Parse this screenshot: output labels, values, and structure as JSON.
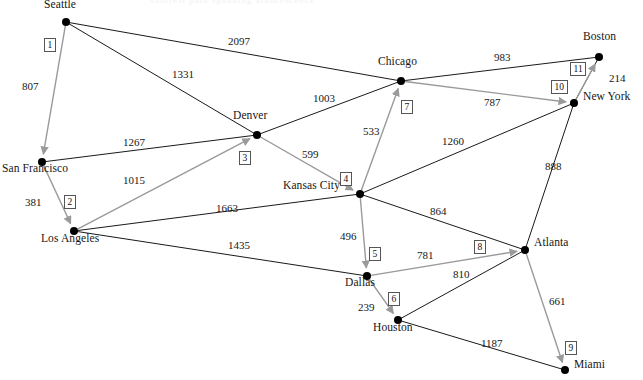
{
  "figure": {
    "title": "",
    "ghost_caption_fragment": "shortest path spanning arborescence",
    "width": 643,
    "height": 380,
    "background_color": "#ffffff",
    "tree_edge_color": "#9a9a9a",
    "graph_edge_color": "#1a1a1a",
    "node_color": "#000000"
  },
  "chart_data": {
    "type": "diagram",
    "diagram_kind": "weighted-directed-graph",
    "title": "",
    "nodes": [
      {
        "id": "seattle",
        "label": "Seattle",
        "x": 66,
        "y": 22,
        "label_dx": -22,
        "label_dy": -16
      },
      {
        "id": "san_francisco",
        "label": "San Francisco",
        "x": 42,
        "y": 162,
        "label_dx": -40,
        "label_dy": 8
      },
      {
        "id": "los_angeles",
        "label": "Los Angeles",
        "x": 74,
        "y": 231,
        "label_dx": -33,
        "label_dy": 9
      },
      {
        "id": "denver",
        "label": "Denver",
        "x": 257,
        "y": 135,
        "label_dx": -24,
        "label_dy": -18
      },
      {
        "id": "kansas_city",
        "label": "Kansas City",
        "x": 360,
        "y": 194,
        "label_dx": -77,
        "label_dy": -7
      },
      {
        "id": "chicago",
        "label": "Chicago",
        "x": 401,
        "y": 81,
        "label_dx": -23,
        "label_dy": -18
      },
      {
        "id": "boston",
        "label": "Boston",
        "x": 599,
        "y": 57,
        "label_dx": -16,
        "label_dy": -19
      },
      {
        "id": "new_york",
        "label": "New York",
        "x": 574,
        "y": 103,
        "label_dx": 9,
        "label_dy": -5
      },
      {
        "id": "atlanta",
        "label": "Atlanta",
        "x": 525,
        "y": 250,
        "label_dx": 9,
        "label_dy": -6
      },
      {
        "id": "dallas",
        "label": "Dallas",
        "x": 367,
        "y": 276,
        "label_dx": -22,
        "label_dy": 8
      },
      {
        "id": "houston",
        "label": "Houston",
        "x": 398,
        "y": 320,
        "label_dx": -25,
        "label_dy": 9
      },
      {
        "id": "miami",
        "label": "Miami",
        "x": 565,
        "y": 370,
        "label_dx": 9,
        "label_dy": -4
      }
    ],
    "edges": [
      {
        "from": "seattle",
        "to": "san_francisco",
        "weight": "807",
        "selected": true,
        "step": "1",
        "wx": 22,
        "wy": 80,
        "sx": 44,
        "sy": 38
      },
      {
        "from": "seattle",
        "to": "chicago",
        "weight": "2097",
        "selected": false,
        "step": "",
        "wx": 228,
        "wy": 35,
        "sx": 0,
        "sy": 0
      },
      {
        "from": "seattle",
        "to": "denver",
        "weight": "1331",
        "selected": false,
        "step": "",
        "wx": 172,
        "wy": 68,
        "sx": 0,
        "sy": 0
      },
      {
        "from": "san_francisco",
        "to": "los_angeles",
        "weight": "381",
        "selected": true,
        "step": "2",
        "wx": 25,
        "wy": 196,
        "sx": 64,
        "sy": 195
      },
      {
        "from": "san_francisco",
        "to": "denver",
        "weight": "1267",
        "selected": false,
        "step": "",
        "wx": 123,
        "wy": 136,
        "sx": 0,
        "sy": 0
      },
      {
        "from": "los_angeles",
        "to": "denver",
        "weight": "1015",
        "selected": true,
        "step": "3",
        "wx": 123,
        "wy": 174,
        "sx": 239,
        "sy": 151
      },
      {
        "from": "los_angeles",
        "to": "kansas_city",
        "weight": "1663",
        "selected": false,
        "step": "",
        "wx": 216,
        "wy": 202,
        "sx": 0,
        "sy": 0
      },
      {
        "from": "los_angeles",
        "to": "dallas",
        "weight": "1435",
        "selected": false,
        "step": "",
        "wx": 228,
        "wy": 239,
        "sx": 0,
        "sy": 0
      },
      {
        "from": "denver",
        "to": "kansas_city",
        "weight": "599",
        "selected": true,
        "step": "4",
        "wx": 302,
        "wy": 148,
        "sx": 340,
        "sy": 172
      },
      {
        "from": "denver",
        "to": "chicago",
        "weight": "1003",
        "selected": false,
        "step": "",
        "wx": 313,
        "wy": 92,
        "sx": 0,
        "sy": 0
      },
      {
        "from": "kansas_city",
        "to": "chicago",
        "weight": "533",
        "selected": true,
        "step": "7",
        "wx": 363,
        "wy": 125,
        "sx": 401,
        "sy": 100
      },
      {
        "from": "kansas_city",
        "to": "dallas",
        "weight": "496",
        "selected": true,
        "step": "5",
        "wx": 340,
        "wy": 230,
        "sx": 369,
        "sy": 247
      },
      {
        "from": "kansas_city",
        "to": "atlanta",
        "weight": "864",
        "selected": false,
        "step": "",
        "wx": 430,
        "wy": 205,
        "sx": 0,
        "sy": 0
      },
      {
        "from": "kansas_city",
        "to": "new_york",
        "weight": "1260",
        "selected": false,
        "step": "",
        "wx": 442,
        "wy": 135,
        "sx": 0,
        "sy": 0
      },
      {
        "from": "chicago",
        "to": "boston",
        "weight": "983",
        "selected": false,
        "step": "",
        "wx": 494,
        "wy": 51,
        "sx": 0,
        "sy": 0
      },
      {
        "from": "chicago",
        "to": "new_york",
        "weight": "787",
        "selected": true,
        "step": "10",
        "wx": 484,
        "wy": 96,
        "sx": 551,
        "sy": 80
      },
      {
        "from": "boston",
        "to": "new_york",
        "weight": "214",
        "selected": false,
        "step": "",
        "wx": 609,
        "wy": 72,
        "sx": 0,
        "sy": 0
      },
      {
        "from": "new_york",
        "to": "boston",
        "weight": "",
        "selected": true,
        "step": "11",
        "wx": 0,
        "wy": 0,
        "sx": 570,
        "sy": 62
      },
      {
        "from": "new_york",
        "to": "atlanta",
        "weight": "888",
        "selected": false,
        "step": "",
        "wx": 545,
        "wy": 160,
        "sx": 0,
        "sy": 0
      },
      {
        "from": "dallas",
        "to": "atlanta",
        "weight": "781",
        "selected": true,
        "step": "8",
        "wx": 417,
        "wy": 249,
        "sx": 474,
        "sy": 240
      },
      {
        "from": "dallas",
        "to": "houston",
        "weight": "239",
        "selected": true,
        "step": "6",
        "wx": 358,
        "wy": 301,
        "sx": 388,
        "sy": 292
      },
      {
        "from": "houston",
        "to": "atlanta",
        "weight": "810",
        "selected": false,
        "step": "",
        "wx": 453,
        "wy": 268,
        "sx": 0,
        "sy": 0
      },
      {
        "from": "houston",
        "to": "miami",
        "weight": "1187",
        "selected": false,
        "step": "",
        "wx": 481,
        "wy": 337,
        "sx": 0,
        "sy": 0
      },
      {
        "from": "atlanta",
        "to": "miami",
        "weight": "661",
        "selected": true,
        "step": "9",
        "wx": 549,
        "wy": 295,
        "sx": 565,
        "sy": 341
      }
    ],
    "legend": []
  }
}
